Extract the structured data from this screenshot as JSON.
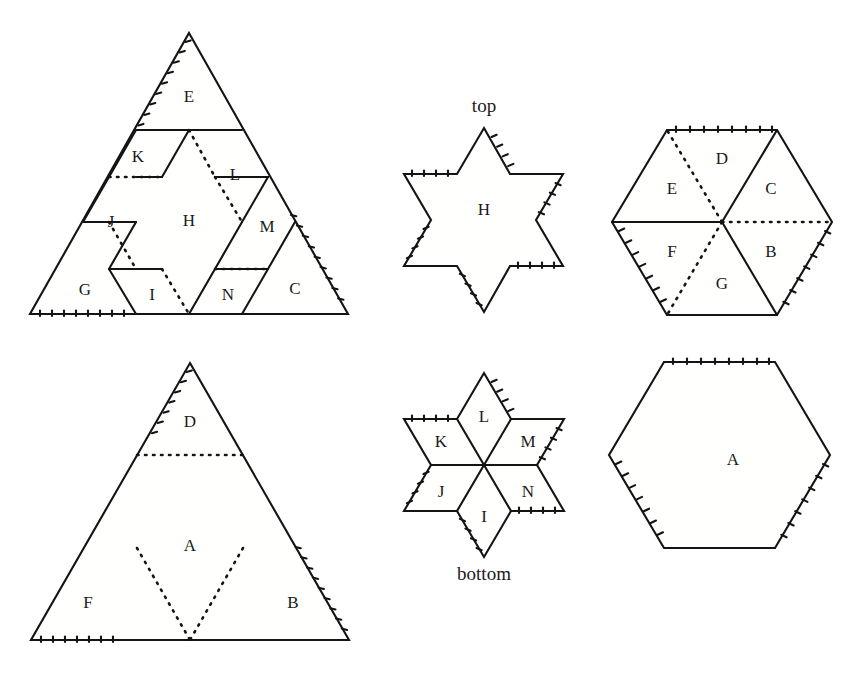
{
  "figure": {
    "kind": "geometric-dissection-diagram",
    "captions": [
      {
        "id": "top",
        "text": "top",
        "x": 484,
        "y": 112
      },
      {
        "id": "bottom",
        "text": "bottom",
        "x": 484,
        "y": 580
      }
    ],
    "panels": [
      {
        "id": "top-left-triangle",
        "name": "upward-triangle-dissected-star",
        "shape": "triangle",
        "labels": [
          {
            "text": "E",
            "x": 189,
            "y": 98
          },
          {
            "text": "K",
            "x": 138,
            "y": 158
          },
          {
            "text": "L",
            "x": 235,
            "y": 176
          },
          {
            "text": "J",
            "x": 111,
            "y": 223
          },
          {
            "text": "H",
            "x": 189,
            "y": 222
          },
          {
            "text": "M",
            "x": 267,
            "y": 228
          },
          {
            "text": "G",
            "x": 85,
            "y": 291
          },
          {
            "text": "I",
            "x": 152,
            "y": 296
          },
          {
            "text": "N",
            "x": 228,
            "y": 296
          },
          {
            "text": "C",
            "x": 295,
            "y": 290
          }
        ]
      },
      {
        "id": "bottom-left-triangle",
        "name": "upward-triangle-dissected-hexagon",
        "shape": "triangle",
        "labels": [
          {
            "text": "D",
            "x": 190,
            "y": 423
          },
          {
            "text": "A",
            "x": 190,
            "y": 547
          },
          {
            "text": "F",
            "x": 88,
            "y": 604
          },
          {
            "text": "B",
            "x": 293,
            "y": 604
          }
        ]
      },
      {
        "id": "top-middle-star",
        "name": "hexagram-outline-top",
        "shape": "hexagram",
        "labels": [
          {
            "text": "H",
            "x": 484,
            "y": 211
          }
        ]
      },
      {
        "id": "bottom-middle-star",
        "name": "hexagram-dissected-bottom",
        "shape": "hexagram",
        "labels": [
          {
            "text": "L",
            "x": 484,
            "y": 418
          },
          {
            "text": "K",
            "x": 441,
            "y": 443
          },
          {
            "text": "M",
            "x": 528,
            "y": 443
          },
          {
            "text": "J",
            "x": 441,
            "y": 493
          },
          {
            "text": "N",
            "x": 528,
            "y": 493
          },
          {
            "text": "I",
            "x": 484,
            "y": 518
          }
        ]
      },
      {
        "id": "top-right-hexagon",
        "name": "hexagon-dissected-six-pieces",
        "shape": "hexagon",
        "labels": [
          {
            "text": "D",
            "x": 722,
            "y": 160
          },
          {
            "text": "C",
            "x": 771,
            "y": 190
          },
          {
            "text": "E",
            "x": 672,
            "y": 190
          },
          {
            "text": "B",
            "x": 771,
            "y": 253
          },
          {
            "text": "F",
            "x": 672,
            "y": 253
          },
          {
            "text": "G",
            "x": 722,
            "y": 285
          }
        ]
      },
      {
        "id": "bottom-right-hexagon",
        "name": "hexagon-single-piece",
        "shape": "hexagon",
        "labels": [
          {
            "text": "A",
            "x": 733,
            "y": 461
          }
        ]
      }
    ],
    "piece_ids": [
      "A",
      "B",
      "C",
      "D",
      "E",
      "F",
      "G",
      "H",
      "I",
      "J",
      "K",
      "L",
      "M",
      "N"
    ],
    "colors": {
      "stroke": "#141414",
      "background": "#ffffff",
      "label": "#1a1a1a"
    }
  }
}
